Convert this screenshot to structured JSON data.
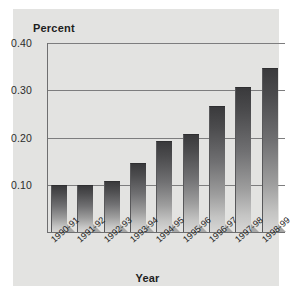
{
  "chart_data": {
    "type": "bar",
    "title": "",
    "xlabel": "Year",
    "ylabel": "Percent",
    "categories": [
      "1990-91",
      "1991-92",
      "1992-93",
      "1993-94",
      "1994-95",
      "1995-96",
      "1996-97",
      "1997-98",
      "1998-99"
    ],
    "values": [
      0.098,
      0.098,
      0.105,
      0.143,
      0.19,
      0.205,
      0.265,
      0.305,
      0.345
    ],
    "ylim": [
      0.0,
      0.4
    ],
    "ytick_labels": [
      "0.10",
      "0.20",
      "0.30",
      "0.40"
    ],
    "ytick_values": [
      0.1,
      0.2,
      0.3,
      0.4
    ],
    "grid": "horizontal-only",
    "legend": "none",
    "series_name": "Percent"
  },
  "axes": {
    "y_title": "Percent",
    "x_title": "Year"
  },
  "colors": {
    "page_background": "#ffffff",
    "panel_background": "#e3e3e1",
    "gridline": "#7d7d7e",
    "axis": "#6f6f70",
    "bar_top": "#3a3a3c",
    "bar_bottom": "#d7d7d6",
    "bar_shadow": "#a8a8a7",
    "text": "#1e1e1e"
  }
}
